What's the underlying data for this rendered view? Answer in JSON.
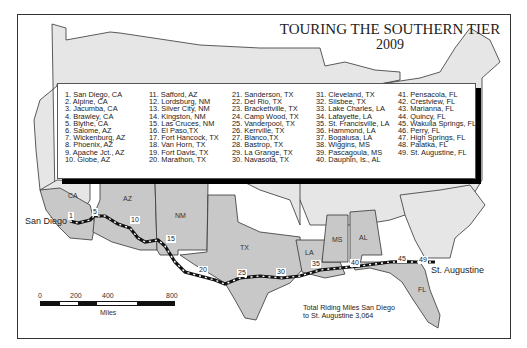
{
  "title": {
    "line1": "TOURING THE SOUTHERN TIER",
    "line2": "2009"
  },
  "legend": {
    "columns": [
      [
        "1. San Diego, CA",
        "2. Alpine, CA",
        "3. Jacumba, CA",
        "4. Brawley, CA",
        "5. Blythe, CA",
        "6. Salome, AZ",
        "7. Wickenburg, AZ",
        "8. Phoenix, AZ",
        "9. Apache Jct., AZ",
        "10. Globe, AZ"
      ],
      [
        "11. Safford, AZ",
        "12. Lordsburg, NM",
        "13. Silver City, NM",
        "14. Kingston, NM",
        "15. Las Cruces, NM",
        "16. El Paso,TX",
        "17. Fort Hancock, TX",
        "18. Van Horn, TX",
        "19. Fort Davis, TX",
        "20. Marathon, TX"
      ],
      [
        "21. Sanderson, TX",
        "22. Del Rio, TX",
        "23. Brackettville, TX",
        "24. Camp Wood, TX",
        "25. Vanderpool, TX",
        "26. Kerrville, TX",
        "27. Blanco,TX",
        "28. Bastrop, TX",
        "29. La Grange, TX",
        "30. Navasota, TX"
      ],
      [
        "31. Cleveland, TX",
        "32. Silsbee, TX",
        "33. Lake Charles, LA",
        "34. Lafayette, LA",
        "35. St. Francisville, LA",
        "36. Hammond, LA",
        "37. Bogalusa, LA",
        "38. Wiggins, MS",
        "39. Pascagoula, MS",
        "40. Dauphin, Is., AL"
      ],
      [
        "41. Pensacola, FL",
        "42. Crestview, FL",
        "43. Marianna, FL",
        "44. Quincy, FL",
        "45. Wakulla Springs, FL",
        "46. Perry, FL",
        "47. High Springs, FL",
        "48. Palatka, FL",
        "49. St. Augustine, FL"
      ]
    ]
  },
  "state_labels": [
    "CA",
    "AZ",
    "NM",
    "TX",
    "LA",
    "MS",
    "AL",
    "FL"
  ],
  "cities": {
    "start": "San Diego",
    "end": "St. Augustine"
  },
  "route_markers": [
    "1",
    "5",
    "10",
    "15",
    "20",
    "25",
    "30",
    "35",
    "40",
    "45",
    "49"
  ],
  "scale": {
    "ticks": [
      "0",
      "200",
      "400",
      "800"
    ],
    "unit": "Miles"
  },
  "total": {
    "line1": "Total Riding Miles San Diego",
    "line2": "to St. Augustine 3,064"
  },
  "colors": {
    "highlight_state": "#c8c8c8",
    "other_state": "#e6e6e6",
    "border": "#333333",
    "route": "#111111"
  }
}
